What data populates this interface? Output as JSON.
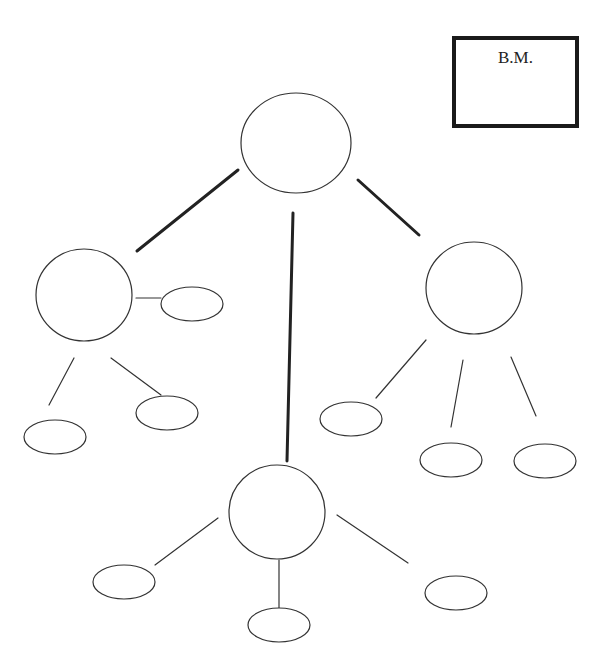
{
  "diagram": {
    "type": "concept-map",
    "corner_box": {
      "label": "B.M."
    },
    "colors": {
      "stroke": "#333333",
      "thick_stroke": "#222222",
      "background": "#ffffff"
    },
    "nodes": [
      {
        "id": "root",
        "shape": "circle",
        "cx": 296,
        "cy": 143,
        "rx": 55,
        "ry": 50,
        "label": ""
      },
      {
        "id": "left",
        "shape": "circle",
        "cx": 84,
        "cy": 295,
        "rx": 48,
        "ry": 46,
        "label": ""
      },
      {
        "id": "right",
        "shape": "circle",
        "cx": 474,
        "cy": 288,
        "rx": 48,
        "ry": 46,
        "label": ""
      },
      {
        "id": "bottom",
        "shape": "circle",
        "cx": 277,
        "cy": 512,
        "rx": 48,
        "ry": 47,
        "label": ""
      },
      {
        "id": "left-side",
        "shape": "ellipse",
        "cx": 192,
        "cy": 304,
        "rx": 31,
        "ry": 17,
        "label": ""
      },
      {
        "id": "left-a",
        "shape": "ellipse",
        "cx": 55,
        "cy": 437,
        "rx": 31,
        "ry": 17,
        "label": ""
      },
      {
        "id": "left-b",
        "shape": "ellipse",
        "cx": 167,
        "cy": 413,
        "rx": 31,
        "ry": 17,
        "label": ""
      },
      {
        "id": "right-a",
        "shape": "ellipse",
        "cx": 351,
        "cy": 419,
        "rx": 31,
        "ry": 17,
        "label": ""
      },
      {
        "id": "right-b",
        "shape": "ellipse",
        "cx": 451,
        "cy": 460,
        "rx": 31,
        "ry": 17,
        "label": ""
      },
      {
        "id": "right-c",
        "shape": "ellipse",
        "cx": 545,
        "cy": 461,
        "rx": 31,
        "ry": 17,
        "label": ""
      },
      {
        "id": "bottom-a",
        "shape": "ellipse",
        "cx": 124,
        "cy": 582,
        "rx": 31,
        "ry": 17,
        "label": ""
      },
      {
        "id": "bottom-b",
        "shape": "ellipse",
        "cx": 279,
        "cy": 625,
        "rx": 31,
        "ry": 17,
        "label": ""
      },
      {
        "id": "bottom-c",
        "shape": "ellipse",
        "cx": 456,
        "cy": 593,
        "rx": 31,
        "ry": 17,
        "label": ""
      }
    ],
    "edges": [
      {
        "from": "root",
        "to": "left",
        "x1": 238,
        "y1": 170,
        "x2": 137,
        "y2": 251,
        "weight": "thick"
      },
      {
        "from": "root",
        "to": "bottom",
        "x1": 293,
        "y1": 213,
        "x2": 287,
        "y2": 461,
        "weight": "thick"
      },
      {
        "from": "root",
        "to": "right",
        "x1": 358,
        "y1": 180,
        "x2": 419,
        "y2": 235,
        "weight": "thick"
      },
      {
        "from": "left",
        "to": "left-side",
        "x1": 136,
        "y1": 298,
        "x2": 161,
        "y2": 298,
        "weight": "thin"
      },
      {
        "from": "left",
        "to": "left-a",
        "x1": 74,
        "y1": 358,
        "x2": 49,
        "y2": 405,
        "weight": "thin"
      },
      {
        "from": "left",
        "to": "left-b",
        "x1": 111,
        "y1": 358,
        "x2": 161,
        "y2": 395,
        "weight": "thin"
      },
      {
        "from": "right",
        "to": "right-a",
        "x1": 426,
        "y1": 340,
        "x2": 376,
        "y2": 398,
        "weight": "thin"
      },
      {
        "from": "right",
        "to": "right-b",
        "x1": 463,
        "y1": 360,
        "x2": 451,
        "y2": 427,
        "weight": "thin"
      },
      {
        "from": "right",
        "to": "right-c",
        "x1": 511,
        "y1": 357,
        "x2": 536,
        "y2": 416,
        "weight": "thin"
      },
      {
        "from": "bottom",
        "to": "bottom-a",
        "x1": 218,
        "y1": 518,
        "x2": 155,
        "y2": 565,
        "weight": "thin"
      },
      {
        "from": "bottom",
        "to": "bottom-b",
        "x1": 279,
        "y1": 560,
        "x2": 279,
        "y2": 612,
        "weight": "thin"
      },
      {
        "from": "bottom",
        "to": "bottom-c",
        "x1": 337,
        "y1": 515,
        "x2": 408,
        "y2": 563,
        "weight": "thin"
      }
    ]
  }
}
